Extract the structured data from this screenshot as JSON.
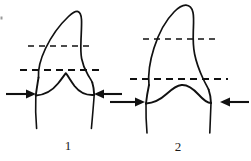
{
  "plate": {
    "background_color": "#ffffff",
    "ink_color": "#111111",
    "width": 251,
    "height": 161,
    "description": "Two line-drawn tooth outlines shown in comparison, each marked with two horizontal dashed reference lines and a pair of opposing arrows at the cervical constriction."
  },
  "figures": [
    {
      "id": "figure-1",
      "caption": "1",
      "apex_shape": "pointed-cusp",
      "dashed_lines": [
        {
          "name": "upper-reference-line",
          "y": 46,
          "x_start": 28,
          "x_end": 92
        },
        {
          "name": "lower-reference-line",
          "y": 70,
          "x_start": 20,
          "x_end": 100
        }
      ],
      "arrows": [
        {
          "name": "left-cervical-arrow",
          "direction": "right",
          "tail_x": 6,
          "tip_x": 32,
          "y": 94
        },
        {
          "name": "right-cervical-arrow",
          "direction": "left",
          "tail_x": 122,
          "tip_x": 94,
          "y": 94
        }
      ],
      "roots": 2
    },
    {
      "id": "figure-2",
      "caption": "2",
      "apex_shape": "rounded-dome",
      "dashed_lines": [
        {
          "name": "upper-reference-line",
          "y": 39,
          "x_start": 143,
          "x_end": 218
        },
        {
          "name": "lower-reference-line",
          "y": 79,
          "x_start": 130,
          "x_end": 228
        }
      ],
      "arrows": [
        {
          "name": "left-cervical-arrow",
          "direction": "right",
          "tail_x": 110,
          "tip_x": 140,
          "y": 102
        },
        {
          "name": "right-cervical-arrow",
          "direction": "left",
          "tail_x": 248,
          "tip_x": 220,
          "y": 102
        }
      ],
      "roots": 2
    }
  ],
  "marks": [
    {
      "name": "edge-speck",
      "x": 1,
      "y": 17
    }
  ]
}
